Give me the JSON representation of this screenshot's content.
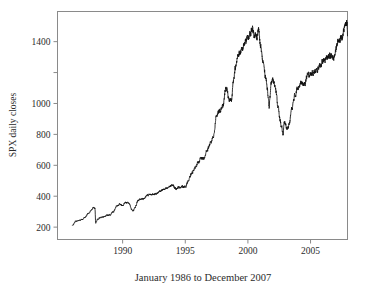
{
  "chart_data": {
    "type": "line",
    "title": "",
    "subtitle": "",
    "caption": "January 1986 to December 2007",
    "xlabel": "January 1986 to December 2007",
    "ylabel": "SPX daily closes",
    "series_name": "SPX daily closes",
    "xlim": [
      1984.8,
      2007.95
    ],
    "ylim": [
      120,
      1595
    ],
    "grid": false,
    "legend": false,
    "legend_position": "none",
    "line_color": "#111111",
    "frame_color": "#8a8a8a",
    "background_color": "#ffffff",
    "x_ticks": [
      1990,
      1995,
      2000,
      2005
    ],
    "x_tick_labels": [
      "1990",
      "1995",
      "2000",
      "2005"
    ],
    "y_ticks": [
      200,
      400,
      600,
      800,
      1000,
      1200,
      1400
    ],
    "y_tick_labels": [
      "200",
      "400",
      "600",
      "800",
      "1000",
      "",
      "1400"
    ],
    "y_axis_note": "tick at 1200 is drawn but unlabeled",
    "data_description": "S&P 500 index daily closing values plotted as a dense noisy line from January 1986 through December 2007",
    "x": [
      1986.0,
      1986.25,
      1986.5,
      1986.75,
      1987.0,
      1987.25,
      1987.5,
      1987.67,
      1987.79,
      1987.85,
      1988.0,
      1988.25,
      1988.5,
      1988.75,
      1989.0,
      1989.25,
      1989.5,
      1989.75,
      1990.0,
      1990.25,
      1990.5,
      1990.75,
      1990.83,
      1991.0,
      1991.25,
      1991.5,
      1991.75,
      1992.0,
      1992.25,
      1992.5,
      1992.75,
      1993.0,
      1993.25,
      1993.5,
      1993.75,
      1994.0,
      1994.25,
      1994.5,
      1994.75,
      1995.0,
      1995.25,
      1995.5,
      1995.75,
      1996.0,
      1996.25,
      1996.5,
      1996.75,
      1997.0,
      1997.25,
      1997.5,
      1997.75,
      1998.0,
      1998.25,
      1998.5,
      1998.7,
      1998.85,
      1999.0,
      1999.25,
      1999.5,
      1999.75,
      2000.0,
      2000.2,
      2000.35,
      2000.5,
      2000.7,
      2000.85,
      2001.0,
      2001.2,
      2001.4,
      2001.55,
      2001.7,
      2001.75,
      2001.9,
      2002.0,
      2002.2,
      2002.4,
      2002.55,
      2002.7,
      2002.8,
      2002.9,
      2003.0,
      2003.15,
      2003.3,
      2003.5,
      2003.75,
      2004.0,
      2004.25,
      2004.5,
      2004.75,
      2005.0,
      2005.25,
      2005.5,
      2005.75,
      2006.0,
      2006.25,
      2006.4,
      2006.6,
      2006.85,
      2007.0,
      2007.25,
      2007.5,
      2007.75,
      2007.9,
      2007.95
    ],
    "y": [
      211,
      237,
      245,
      249,
      264,
      290,
      310,
      329,
      321,
      225,
      252,
      262,
      266,
      277,
      280,
      300,
      334,
      348,
      340,
      358,
      356,
      311,
      306,
      330,
      375,
      380,
      387,
      408,
      412,
      414,
      418,
      435,
      443,
      448,
      463,
      470,
      450,
      458,
      462,
      460,
      500,
      545,
      580,
      614,
      645,
      644,
      700,
      740,
      790,
      925,
      950,
      980,
      1100,
      1030,
      1020,
      1160,
      1230,
      1320,
      1340,
      1390,
      1425,
      1450,
      1490,
      1450,
      1430,
      1480,
      1370,
      1270,
      1180,
      1100,
      970,
      1040,
      1140,
      1150,
      1110,
      980,
      900,
      840,
      800,
      880,
      860,
      835,
      870,
      965,
      1050,
      1110,
      1130,
      1120,
      1180,
      1190,
      1200,
      1210,
      1250,
      1270,
      1290,
      1300,
      1310,
      1290,
      1350,
      1410,
      1430,
      1500,
      1520,
      1470,
      1480,
      1450
    ]
  },
  "axes": {
    "ylabel": "SPX daily closes",
    "xtick_1990": "1990",
    "xtick_1995": "1995",
    "xtick_2000": "2000",
    "xtick_2005": "2005",
    "ytick_200": "200",
    "ytick_400": "400",
    "ytick_600": "600",
    "ytick_800": "800",
    "ytick_1000": "1000",
    "ytick_1400": "1400"
  },
  "caption": {
    "text": "January 1986 to December 2007"
  }
}
